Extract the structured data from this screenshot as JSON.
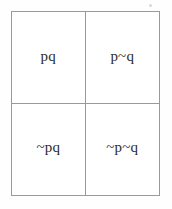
{
  "figure": {
    "kind": "logic-truth-grid",
    "background_color": "#fefefe",
    "border_color": "#9a9a9a",
    "text_color": "#2b2b2b",
    "rows": 2,
    "columns": 2
  },
  "grid": {
    "cells": [
      {
        "id": "cell-top-left",
        "label": "pq"
      },
      {
        "id": "cell-top-right",
        "label": "p~q"
      },
      {
        "id": "cell-bottom-left",
        "label": "~pq"
      },
      {
        "id": "cell-bottom-right",
        "label": "~p~q"
      }
    ]
  },
  "artifacts": {
    "speck_name": "scan-speck"
  }
}
